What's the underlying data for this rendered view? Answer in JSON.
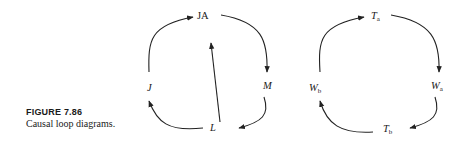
{
  "caption": {
    "title": "FIGURE 7.86",
    "text": "Causal loop diagrams."
  },
  "diagrams": [
    {
      "name": "left-loop",
      "nodes": [
        {
          "id": "JA",
          "label": "JA",
          "italic": false
        },
        {
          "id": "M",
          "label": "M",
          "italic": true
        },
        {
          "id": "L",
          "label": "L",
          "italic": true
        },
        {
          "id": "J",
          "label": "J",
          "italic": true
        }
      ],
      "edges": [
        {
          "from": "J",
          "to": "JA"
        },
        {
          "from": "JA",
          "to": "M"
        },
        {
          "from": "M",
          "to": "L"
        },
        {
          "from": "L",
          "to": "J"
        },
        {
          "from": "L",
          "to": "JA"
        }
      ]
    },
    {
      "name": "right-loop",
      "nodes": [
        {
          "id": "Ta",
          "label": "T",
          "sub": "a"
        },
        {
          "id": "Wa",
          "label": "W",
          "sub": "a"
        },
        {
          "id": "Tb",
          "label": "T",
          "sub": "b"
        },
        {
          "id": "Wb",
          "label": "W",
          "sub": "b"
        }
      ],
      "edges": [
        {
          "from": "Wb",
          "to": "Ta"
        },
        {
          "from": "Ta",
          "to": "Wa"
        },
        {
          "from": "Wa",
          "to": "Tb"
        },
        {
          "from": "Tb",
          "to": "Wb"
        }
      ]
    }
  ]
}
